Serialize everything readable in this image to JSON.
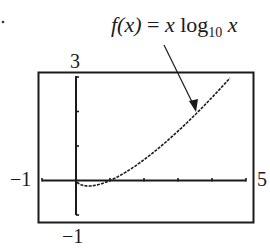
{
  "chart_data": {
    "type": "line",
    "title": "f(x) = x log10 x",
    "function": "x*log10(x)",
    "xlabel": "",
    "ylabel": "",
    "xlim": [
      -1,
      5
    ],
    "ylim": [
      -1,
      3
    ],
    "x_tick_step": 1,
    "y_tick_step": 1,
    "grid": false,
    "legend": "none",
    "annotation": {
      "text_parts": {
        "fx": "f(x)",
        "eq": " = ",
        "x1": "x",
        "log": " log",
        "base": "10",
        "x2": " x"
      },
      "arrow_to": [
        3.5,
        1.9
      ]
    },
    "window_labels": {
      "xmin": "−1",
      "xmax": "5",
      "ymin": "−1",
      "ymax": "3"
    },
    "series": [
      {
        "name": "f(x) = x log10 x",
        "x": [
          0.05,
          0.1,
          0.2,
          0.3,
          0.368,
          0.5,
          0.7,
          1.0,
          1.5,
          2.0,
          2.5,
          3.0,
          3.5,
          4.0,
          4.5
        ],
        "y": [
          -0.065,
          -0.1,
          -0.14,
          -0.157,
          -0.16,
          -0.151,
          -0.108,
          0.0,
          0.264,
          0.602,
          0.995,
          1.431,
          1.904,
          2.408,
          2.939
        ]
      }
    ]
  }
}
